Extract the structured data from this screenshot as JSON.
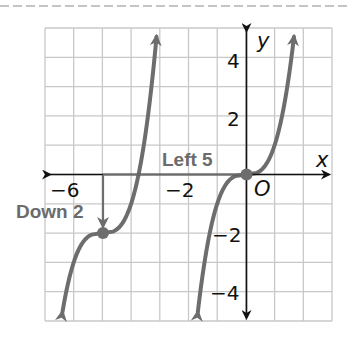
{
  "graph": {
    "x_range": [
      -7,
      3
    ],
    "y_range": [
      -5,
      5
    ],
    "axis_labels": {
      "x": "x",
      "y": "y",
      "origin": "O"
    },
    "x_tick_labels": [
      {
        "value": -6,
        "text": "−6"
      },
      {
        "value": -2,
        "text": "−2"
      }
    ],
    "y_tick_labels": [
      {
        "value": 4,
        "text": "4"
      },
      {
        "value": 2,
        "text": "2"
      },
      {
        "value": -2,
        "text": "−2"
      },
      {
        "value": -4,
        "text": "−4"
      }
    ],
    "annotations": {
      "left": "Left 5",
      "down": "Down 2"
    },
    "parent_function": "y = x^3",
    "translated_function": "y = (x + 5)^3 - 2",
    "key_points": [
      {
        "x": 0,
        "y": 0
      },
      {
        "x": -5,
        "y": -2
      }
    ],
    "colors": {
      "curve": "#6d6d6d",
      "axis": "#111111",
      "grid": "#c8c8c8",
      "annotation_text": "#6b6b6b",
      "dashed_rule": "#c4c4c4"
    }
  }
}
